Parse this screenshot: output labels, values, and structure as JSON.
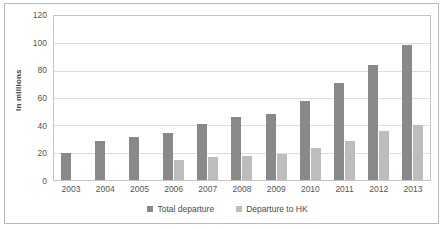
{
  "chart_data": {
    "type": "bar",
    "title": "",
    "subtitle": "",
    "xlabel": "",
    "ylabel": "In millions",
    "ylim": [
      0,
      120
    ],
    "yticks": [
      0,
      20,
      40,
      60,
      80,
      100,
      120
    ],
    "grid": true,
    "legend_position": "bottom",
    "categories": [
      "2003",
      "2004",
      "2005",
      "2006",
      "2007",
      "2008",
      "2009",
      "2010",
      "2011",
      "2012",
      "2013"
    ],
    "series": [
      {
        "name": "Total departure",
        "color": "#898989",
        "values": [
          20,
          28.5,
          31.5,
          34.5,
          41,
          46,
          48,
          58,
          71,
          84,
          98.5
        ]
      },
      {
        "name": "Departure to HK",
        "color": "#bdbdbd",
        "values": [
          0,
          0,
          0,
          15,
          16.5,
          17.5,
          19,
          23.5,
          28.5,
          36,
          40
        ]
      }
    ]
  },
  "colors": {
    "series_total_departure": "#898989",
    "series_departure_to_hk": "#bdbdbd",
    "gridline": "#dedede",
    "plot_border": "#c4c4c4",
    "outer_border": "#b9b9b9",
    "tick_text": "#555555",
    "axis_title_text": "#3f3f3f"
  }
}
